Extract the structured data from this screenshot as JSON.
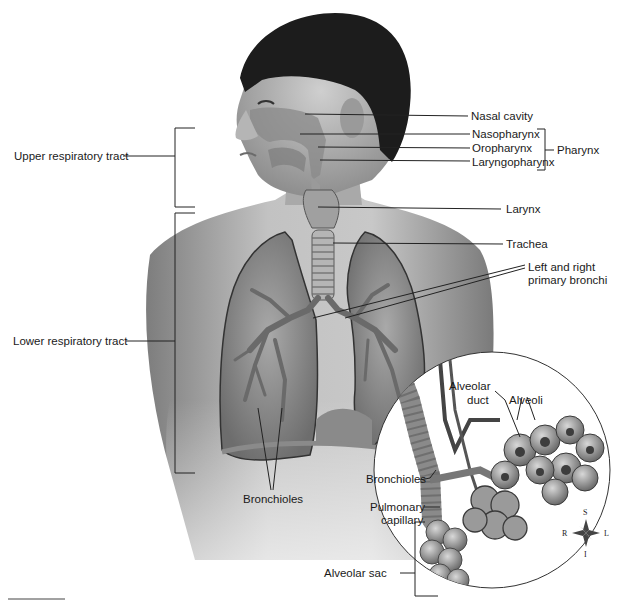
{
  "diagram": {
    "colors": {
      "background": "#ffffff",
      "skin": "#b8b8b8",
      "hair": "#1c1c1c",
      "lung": "#8e8e8e",
      "airway": "#a6a6a6",
      "leader_line": "#222222",
      "text": "#1a1a1a"
    },
    "region_labels": {
      "upper": "Upper respiratory tract",
      "lower": "Lower respiratory tract"
    },
    "structure_labels": {
      "nasal_cavity": "Nasal cavity",
      "nasopharynx": "Nasopharynx",
      "oropharynx": "Oropharynx",
      "laryngopharynx": "Laryngopharynx",
      "pharynx": "Pharynx",
      "larynx": "Larynx",
      "trachea": "Trachea",
      "primary_bronchi_line1": "Left and right",
      "primary_bronchi_line2": "primary bronchi",
      "bronchioles_lung": "Bronchioles"
    },
    "inset_labels": {
      "alveolar_duct_line1": "Alveolar",
      "alveolar_duct_line2": "duct",
      "alveoli": "Alveoli",
      "bronchioles": "Bronchioles",
      "pulmonary_capillary_line1": "Pulmonary",
      "pulmonary_capillary_line2": "capillary",
      "alveolar_sac": "Alveolar sac"
    },
    "compass": {
      "superior": "S",
      "inferior": "I",
      "right": "R",
      "left": "L"
    }
  }
}
